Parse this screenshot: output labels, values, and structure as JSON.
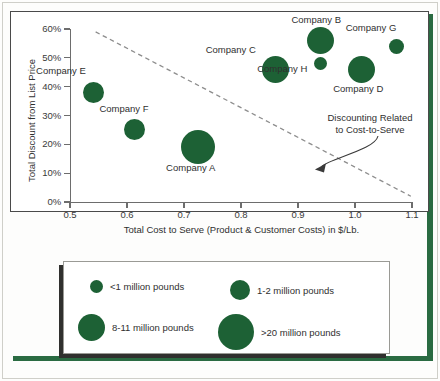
{
  "chart_data": {
    "type": "scatter",
    "title": "",
    "xlabel": "Total Cost to Serve (Product & Customer Costs) in $/Lb.",
    "ylabel": "Total Discount from List Price",
    "xlim": [
      0.5,
      1.1
    ],
    "ylim": [
      0,
      60
    ],
    "xticks": [
      "0.5",
      "0.6",
      "0.7",
      "0.8",
      "0.9",
      "1.0",
      "1.1"
    ],
    "xtick_values": [
      0.5,
      0.6,
      0.7,
      0.8,
      0.9,
      1.0,
      1.1
    ],
    "yticks": [
      "0%",
      "10%",
      "20%",
      "30%",
      "40%",
      "50%",
      "60%"
    ],
    "ytick_values": [
      0,
      10,
      20,
      30,
      40,
      50,
      60
    ],
    "grid": false,
    "legend_position": "below-plot",
    "bubble_color": "#1d6135",
    "points": [
      {
        "label": "Company E",
        "x": 0.542,
        "y": 38,
        "size_px": 21,
        "volume_class": "8-11 million pounds",
        "label_dx": -33,
        "label_dy": -21
      },
      {
        "label": "Company F",
        "x": 0.614,
        "y": 25,
        "size_px": 21,
        "volume_class": "8-11 million pounds",
        "label_dx": -11,
        "label_dy": -21
      },
      {
        "label": "Company A",
        "x": 0.724,
        "y": 19,
        "size_px": 34,
        "volume_class": ">20 million pounds",
        "label_dx": -7,
        "label_dy": 21
      },
      {
        "label": "Company C",
        "x": 0.861,
        "y": 46,
        "size_px": 27,
        "volume_class": "1-2 million pounds",
        "label_dx": -45,
        "label_dy": -19
      },
      {
        "label": "Company B",
        "x": 0.939,
        "y": 56,
        "size_px": 27,
        "volume_class": "1-2 million pounds",
        "label_dx": -4,
        "label_dy": -21
      },
      {
        "label": "Company H",
        "x": 0.939,
        "y": 48,
        "size_px": 13,
        "volume_class": "<1 million pounds",
        "label_dx": -38,
        "label_dy": 5
      },
      {
        "label": "Company D",
        "x": 1.011,
        "y": 46,
        "size_px": 27,
        "volume_class": "1-2 million pounds",
        "label_dx": -3,
        "label_dy": 20
      },
      {
        "label": "Company G",
        "x": 1.072,
        "y": 54,
        "size_px": 15,
        "volume_class": "<1 million pounds",
        "label_dx": -25,
        "label_dy": -18
      }
    ],
    "trend_line": {
      "style": "dashed",
      "color": "#8d8d8d",
      "x_start": 0.545,
      "y_start": 59,
      "x_end": 1.098,
      "y_end": 2
    },
    "annotation": {
      "line1": "Discounting Related",
      "line2": "to Cost-to-Serve",
      "arrow_target_x": 0.935,
      "arrow_target_y": 12
    },
    "legend": {
      "entries": [
        {
          "label": "<1 million pounds",
          "dot_px": 13
        },
        {
          "label": "1-2 million pounds",
          "dot_px": 20
        },
        {
          "label": "8-11 million pounds",
          "dot_px": 27
        },
        {
          "label": ">20 million pounds",
          "dot_px": 36
        }
      ]
    }
  }
}
